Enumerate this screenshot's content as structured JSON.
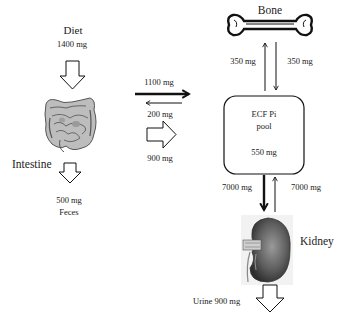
{
  "diagram": {
    "nodes": {
      "diet": {
        "label": "Diet",
        "amount": "1400 mg"
      },
      "intestine": {
        "label": "Intestine"
      },
      "feces": {
        "amount": "500 mg",
        "label": "Feces"
      },
      "bone": {
        "label": "Bone"
      },
      "ecf": {
        "line1": "ECF Pi",
        "line2": "pool",
        "amount": "550 mg"
      },
      "kidney": {
        "label": "Kidney"
      },
      "urine": {
        "label": "Urine 900 mg"
      }
    },
    "flows": {
      "intestine_to_ecf": "1100 mg",
      "ecf_to_intestine": "200 mg",
      "net_absorption": "900 mg",
      "bone_to_ecf": "350 mg",
      "ecf_to_bone": "350 mg",
      "ecf_to_kidney": "7000 mg",
      "kidney_to_ecf": "7000 mg"
    },
    "icons": {
      "diet_arrow": "hollow-down-arrow",
      "feces_arrow": "hollow-down-arrow",
      "net_absorption_arrow": "hollow-right-arrow",
      "urine_arrow": "hollow-down-arrow",
      "intestine_image": "intestine-illustration",
      "bone_image": "bone-illustration",
      "kidney_image": "kidney-illustration"
    },
    "colors": {
      "stroke": "#111111",
      "kidney": "#5a5a5a",
      "intestine": "#8a8a8a"
    }
  }
}
